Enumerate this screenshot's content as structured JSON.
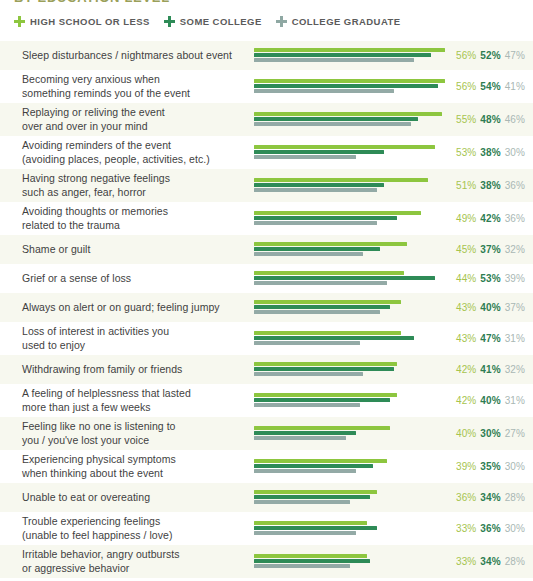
{
  "title": "BY EDUCATION LEVEL",
  "legend": {
    "items": [
      {
        "label": "HIGH SCHOOL OR LESS",
        "color": "#8DC63F",
        "icon": "plus-icon"
      },
      {
        "label": "SOME COLLEGE",
        "color": "#2E8B57",
        "icon": "plus-icon"
      },
      {
        "label": "COLLEGE GRADUATE",
        "color": "#8FA8A3",
        "icon": "plus-icon"
      }
    ]
  },
  "colors": {
    "series1_bar": "#8DC63F",
    "series2_bar": "#2E8B57",
    "series3_bar": "#93AAA6",
    "series1_text": "#A6C44E",
    "series2_text": "#2E7D52",
    "series3_text": "#A9B7B4",
    "row_stripe": "#F7F8EF",
    "row_plain": "#FFFFFF",
    "title_text": "#9AA05A",
    "legend_text": "#5B5B5B",
    "label_text": "#3F3F3F"
  },
  "chart_data": {
    "type": "bar",
    "title": "BY EDUCATION LEVEL",
    "xlabel": "",
    "ylabel": "",
    "xlim": [
      0,
      56
    ],
    "grid": false,
    "legend_position": "top-left",
    "orientation": "horizontal",
    "value_suffix": "%",
    "categories": [
      "Sleep disturbances / nightmares about event",
      "Becoming very anxious when\nsomething reminds you of the event",
      "Replaying or reliving the event\nover and over in your mind",
      "Avoiding reminders of the event\n(avoiding places, people, activities, etc.)",
      "Having strong negative feelings\nsuch as anger, fear, horror",
      "Avoiding thoughts or memories\nrelated to the trauma",
      "Shame or guilt",
      "Grief or a sense of loss",
      "Always on alert or on guard; feeling jumpy",
      "Loss of interest in activities you\nused to enjoy",
      "Withdrawing from family or friends",
      "A feeling of helplessness that lasted\nmore than just a few weeks",
      "Feeling like no one is listening to\nyou / you've lost your voice",
      "Experiencing physical symptoms\nwhen thinking about the event",
      "Unable to eat or overeating",
      "Trouble experiencing feelings\n(unable to feel happiness / love)",
      "Irritable behavior, angry outbursts\nor aggressive behavior"
    ],
    "series": [
      {
        "name": "HIGH SCHOOL OR LESS",
        "color": "#8DC63F",
        "values": [
          56,
          56,
          55,
          53,
          51,
          49,
          45,
          44,
          43,
          43,
          42,
          42,
          40,
          39,
          36,
          33,
          33
        ]
      },
      {
        "name": "SOME COLLEGE",
        "color": "#2E8B57",
        "values": [
          52,
          54,
          48,
          38,
          38,
          42,
          37,
          53,
          40,
          47,
          41,
          40,
          30,
          35,
          34,
          36,
          34
        ]
      },
      {
        "name": "COLLEGE GRADUATE",
        "color": "#93AAA6",
        "values": [
          47,
          41,
          46,
          30,
          36,
          36,
          32,
          39,
          37,
          31,
          32,
          31,
          27,
          30,
          28,
          30,
          28
        ]
      }
    ]
  },
  "rows": [
    {
      "label": "Sleep disturbances / nightmares about event",
      "v1": "56%",
      "v2": "52%",
      "v3": "47%",
      "n1": 56,
      "n2": 52,
      "n3": 47,
      "lines": 1
    },
    {
      "label": "Becoming very anxious when\nsomething reminds you of the event",
      "v1": "56%",
      "v2": "54%",
      "v3": "41%",
      "n1": 56,
      "n2": 54,
      "n3": 41,
      "lines": 2
    },
    {
      "label": "Replaying or reliving the event\nover and over in your mind",
      "v1": "55%",
      "v2": "48%",
      "v3": "46%",
      "n1": 55,
      "n2": 48,
      "n3": 46,
      "lines": 2
    },
    {
      "label": "Avoiding reminders of the event\n(avoiding places, people, activities, etc.)",
      "v1": "53%",
      "v2": "38%",
      "v3": "30%",
      "n1": 53,
      "n2": 38,
      "n3": 30,
      "lines": 2
    },
    {
      "label": "Having strong negative feelings\nsuch as anger, fear, horror",
      "v1": "51%",
      "v2": "38%",
      "v3": "36%",
      "n1": 51,
      "n2": 38,
      "n3": 36,
      "lines": 2
    },
    {
      "label": "Avoiding thoughts or memories\nrelated to the trauma",
      "v1": "49%",
      "v2": "42%",
      "v3": "36%",
      "n1": 49,
      "n2": 42,
      "n3": 36,
      "lines": 2
    },
    {
      "label": "Shame or guilt",
      "v1": "45%",
      "v2": "37%",
      "v3": "32%",
      "n1": 45,
      "n2": 37,
      "n3": 32,
      "lines": 1
    },
    {
      "label": "Grief or a sense of loss",
      "v1": "44%",
      "v2": "53%",
      "v3": "39%",
      "n1": 44,
      "n2": 53,
      "n3": 39,
      "lines": 1
    },
    {
      "label": "Always on alert or on guard; feeling jumpy",
      "v1": "43%",
      "v2": "40%",
      "v3": "37%",
      "n1": 43,
      "n2": 40,
      "n3": 37,
      "lines": 1
    },
    {
      "label": "Loss of interest in activities you\nused to enjoy",
      "v1": "43%",
      "v2": "47%",
      "v3": "31%",
      "n1": 43,
      "n2": 47,
      "n3": 31,
      "lines": 2
    },
    {
      "label": "Withdrawing from family or friends",
      "v1": "42%",
      "v2": "41%",
      "v3": "32%",
      "n1": 42,
      "n2": 41,
      "n3": 32,
      "lines": 1
    },
    {
      "label": "A feeling of helplessness that lasted\nmore than just a few weeks",
      "v1": "42%",
      "v2": "40%",
      "v3": "31%",
      "n1": 42,
      "n2": 40,
      "n3": 31,
      "lines": 2
    },
    {
      "label": "Feeling like no one is listening to\nyou / you've lost your voice",
      "v1": "40%",
      "v2": "30%",
      "v3": "27%",
      "n1": 40,
      "n2": 30,
      "n3": 27,
      "lines": 2
    },
    {
      "label": "Experiencing physical symptoms\nwhen thinking about the event",
      "v1": "39%",
      "v2": "35%",
      "v3": "30%",
      "n1": 39,
      "n2": 35,
      "n3": 30,
      "lines": 2
    },
    {
      "label": "Unable to eat or overeating",
      "v1": "36%",
      "v2": "34%",
      "v3": "28%",
      "n1": 36,
      "n2": 34,
      "n3": 28,
      "lines": 1
    },
    {
      "label": "Trouble experiencing feelings\n(unable to feel happiness / love)",
      "v1": "33%",
      "v2": "36%",
      "v3": "30%",
      "n1": 33,
      "n2": 36,
      "n3": 30,
      "lines": 2
    },
    {
      "label": "Irritable behavior, angry outbursts\nor aggressive behavior",
      "v1": "33%",
      "v2": "34%",
      "v3": "28%",
      "n1": 33,
      "n2": 34,
      "n3": 28,
      "lines": 2
    }
  ]
}
